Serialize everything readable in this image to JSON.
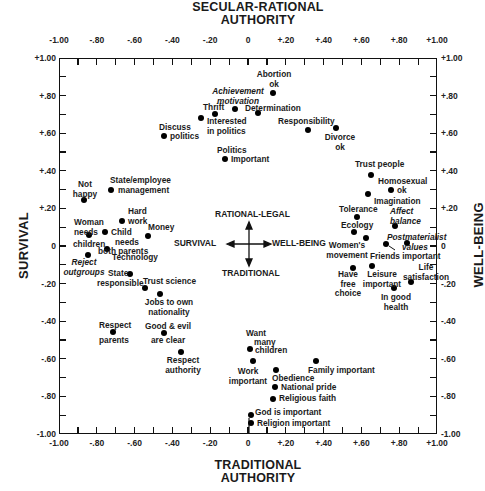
{
  "chart_data": {
    "type": "scatter",
    "title": "",
    "top_label": "SECULAR-RATIONAL AUTHORITY",
    "bottom_label": "TRADITIONAL AUTHORITY",
    "left_label": "SURVIVAL",
    "right_label": "WELL-BEING",
    "xlabel": "Survival / Well-Being",
    "ylabel": "Traditional / Secular-Rational Authority",
    "xlim": [
      -1.0,
      1.0
    ],
    "ylim": [
      -1.0,
      1.0
    ],
    "grid": false,
    "x_ticks": [
      "-1.00",
      "-.80",
      "-.60",
      "-.40",
      "-.20",
      "0",
      "+.20",
      "+.40",
      "+.60",
      "+.80",
      "+1.00"
    ],
    "y_ticks": [
      "+1.00",
      "+.80",
      "+.60",
      "+.40",
      "+.20",
      "0",
      "-.20",
      "-.40",
      "-.60",
      "-.80",
      "-1.00"
    ],
    "legend": {
      "up": "RATIONAL-LEGAL",
      "down": "TRADITIONAL",
      "left": "SURVIVAL",
      "right": "WELL-BEING"
    },
    "points": [
      {
        "label": "Abortion ok",
        "x": 0.13,
        "y": 0.81,
        "italic": false
      },
      {
        "label": "Achievement motivation",
        "x": -0.07,
        "y": 0.73,
        "italic": true
      },
      {
        "label": "Thrift",
        "x": -0.17,
        "y": 0.7,
        "italic": false
      },
      {
        "label": "Interested in politics",
        "x": -0.25,
        "y": 0.68,
        "italic": false
      },
      {
        "label": "Determination",
        "x": 0.05,
        "y": 0.71,
        "italic": false
      },
      {
        "label": "Discuss politics",
        "x": -0.44,
        "y": 0.59,
        "italic": false
      },
      {
        "label": "Responsibility",
        "x": 0.32,
        "y": 0.62,
        "italic": false
      },
      {
        "label": "Divorce ok",
        "x": 0.47,
        "y": 0.63,
        "italic": false
      },
      {
        "label": "Politics important",
        "x": -0.12,
        "y": 0.46,
        "italic": false
      },
      {
        "label": "Trust people",
        "x": 0.65,
        "y": 0.38,
        "italic": false
      },
      {
        "label": "Homosexual ok",
        "x": 0.76,
        "y": 0.3,
        "italic": false
      },
      {
        "label": "Imagination",
        "x": 0.63,
        "y": 0.28,
        "italic": false
      },
      {
        "label": "Not happy",
        "x": -0.87,
        "y": 0.24,
        "italic": false
      },
      {
        "label": "State/employee management",
        "x": -0.72,
        "y": 0.3,
        "italic": false
      },
      {
        "label": "Tolerance",
        "x": 0.58,
        "y": 0.15,
        "italic": false
      },
      {
        "label": "Affect balance",
        "x": 0.78,
        "y": 0.11,
        "italic": true
      },
      {
        "label": "Hard work",
        "x": -0.67,
        "y": 0.13,
        "italic": false
      },
      {
        "label": "Ecology",
        "x": 0.56,
        "y": 0.07,
        "italic": false
      },
      {
        "label": "Woman needs children",
        "x": -0.84,
        "y": 0.06,
        "italic": false
      },
      {
        "label": "Child needs both parents",
        "x": -0.76,
        "y": 0.07,
        "italic": false
      },
      {
        "label": "Money",
        "x": -0.53,
        "y": 0.05,
        "italic": false
      },
      {
        "label": "Women's movement",
        "x": 0.62,
        "y": 0.04,
        "italic": false
      },
      {
        "label": "Friends important",
        "x": 0.73,
        "y": 0.01,
        "italic": false
      },
      {
        "label": "Postmaterialist values",
        "x": 0.84,
        "y": 0.02,
        "italic": true
      },
      {
        "label": "Technology",
        "x": -0.75,
        "y": -0.02,
        "italic": false
      },
      {
        "label": "Reject outgroups",
        "x": -0.85,
        "y": -0.05,
        "italic": true
      },
      {
        "label": "Have free choice",
        "x": 0.56,
        "y": -0.12,
        "italic": false
      },
      {
        "label": "Leisure important",
        "x": 0.66,
        "y": -0.11,
        "italic": false
      },
      {
        "label": "State responsible",
        "x": -0.62,
        "y": -0.15,
        "italic": false
      },
      {
        "label": "Life satisfaction",
        "x": 0.86,
        "y": -0.19,
        "italic": false
      },
      {
        "label": "In good health",
        "x": 0.77,
        "y": -0.22,
        "italic": false
      },
      {
        "label": "Trust science",
        "x": -0.54,
        "y": -0.22,
        "italic": false
      },
      {
        "label": "Jobs to own nationality",
        "x": -0.46,
        "y": -0.26,
        "italic": false
      },
      {
        "label": "Respect parents",
        "x": -0.71,
        "y": -0.46,
        "italic": false
      },
      {
        "label": "Good & evil are clear",
        "x": -0.44,
        "y": -0.46,
        "italic": false
      },
      {
        "label": "Respect authority",
        "x": -0.35,
        "y": -0.56,
        "italic": false
      },
      {
        "label": "Want many children",
        "x": 0.01,
        "y": -0.55,
        "italic": false
      },
      {
        "label": "Work important",
        "x": 0.03,
        "y": -0.61,
        "italic": false
      },
      {
        "label": "Family important",
        "x": 0.36,
        "y": -0.61,
        "italic": false
      },
      {
        "label": "Obedience",
        "x": 0.15,
        "y": -0.66,
        "italic": false
      },
      {
        "label": "National pride",
        "x": 0.14,
        "y": -0.75,
        "italic": false
      },
      {
        "label": "Religious faith",
        "x": 0.13,
        "y": -0.81,
        "italic": false
      },
      {
        "label": "God is important",
        "x": 0.02,
        "y": -0.9,
        "italic": false
      },
      {
        "label": "Religion important",
        "x": 0.02,
        "y": -0.94,
        "italic": false
      }
    ]
  },
  "labels": {
    "top_line1": "SECULAR-RATIONAL",
    "top_line2": "AUTHORITY",
    "bottom_line1": "TRADITIONAL",
    "bottom_line2": "AUTHORITY",
    "left": "SURVIVAL",
    "right": "WELL-BEING",
    "legend_up": "RATIONAL-LEGAL",
    "legend_down": "TRADITIONAL",
    "legend_left": "SURVIVAL",
    "legend_right": "WELL-BEING"
  },
  "point_text": {
    "abortion": [
      "Abortion",
      "ok"
    ],
    "achievement": [
      "Achievement",
      "motivation"
    ],
    "thrift": [
      "Thrift"
    ],
    "interested": [
      "Interested",
      "in politics"
    ],
    "determination": [
      "Determination"
    ],
    "discuss1": "Discuss",
    "discuss2": "politics",
    "responsibility": [
      "Responsibility"
    ],
    "divorce": [
      "Divorce",
      "ok"
    ],
    "politics1": "Politics",
    "politics2": "Important",
    "trust_people": [
      "Trust people"
    ],
    "homosexual1": "Homosexual",
    "homosexual2": "ok",
    "imagination": [
      "Imagination"
    ],
    "not_happy": [
      "Not",
      "happy"
    ],
    "state_emp": [
      "State/employee",
      "management"
    ],
    "tolerance": [
      "Tolerance"
    ],
    "affect": [
      "Affect",
      "balance"
    ],
    "hard_work": [
      "Hard",
      "work"
    ],
    "ecology": [
      "Ecology"
    ],
    "woman_needs": [
      "Woman",
      "needs"
    ],
    "children": "children",
    "child_needs": [
      "Child",
      "needs",
      "both parents"
    ],
    "money": [
      "Money"
    ],
    "womens_mov": [
      "Women's",
      "movement"
    ],
    "friends": [
      "Friends important"
    ],
    "postmat": [
      "Postmaterialist",
      "values"
    ],
    "technology": [
      "Technology"
    ],
    "reject": [
      "Reject",
      "outgroups"
    ],
    "free_choice": [
      "Have",
      "free",
      "choice"
    ],
    "leisure": [
      "Leisure",
      "important"
    ],
    "state_resp1": "State",
    "state_resp2": "responsible",
    "life_sat": [
      "Life",
      "satisfaction"
    ],
    "health": [
      "In good",
      "health"
    ],
    "trust_science": [
      "Trust science"
    ],
    "jobs": [
      "Jobs to own",
      "nationality"
    ],
    "respect_parents1": "Respect",
    "respect_parents2": "parents",
    "good_evil1": "Good & evil",
    "good_evil2": "are clear",
    "respect_auth": [
      "Respect",
      "authority"
    ],
    "want1": "Want",
    "want2": "many",
    "want3": "children",
    "work": [
      "Work",
      "important"
    ],
    "family": [
      "Family important"
    ],
    "obedience": [
      "Obedience"
    ],
    "national": [
      "National pride"
    ],
    "religious": [
      "Religious faith"
    ],
    "god": [
      "God is important"
    ],
    "religion": [
      "Religion important"
    ]
  }
}
